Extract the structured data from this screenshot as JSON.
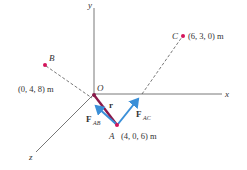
{
  "figure": {
    "axes": {
      "x_label": "x",
      "y_label": "y",
      "z_label": "z",
      "origin_label": "O"
    },
    "points": {
      "A": {
        "name": "A",
        "coords": "(4, 0, 6) m"
      },
      "B": {
        "name": "B",
        "coords": "(0, 4, 8) m"
      },
      "C": {
        "name": "C",
        "coords": "(6, 3, 0) m"
      }
    },
    "vectors": {
      "r": {
        "label": "r"
      },
      "F_AB": {
        "label": "F",
        "subscript": "AB"
      },
      "F_AC": {
        "label": "F",
        "subscript": "AC"
      }
    },
    "colors": {
      "axis": "#555555",
      "point": "#d4145a",
      "position_vector": "#8b1a4a",
      "force_vector": "#3a8fd8",
      "text": "#333333"
    }
  }
}
